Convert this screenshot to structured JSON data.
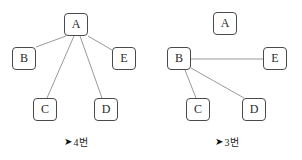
{
  "figure": {
    "background_color": "#ffffff",
    "node_border_color": "#4a4a4a",
    "node_fill_color": "#ffffff",
    "edge_color": "#9a9a9a",
    "text_color": "#2a2a2a"
  },
  "panels": [
    {
      "id": "left",
      "caption": {
        "arrow": "➤",
        "text": "4번"
      },
      "nodes": [
        {
          "id": "A",
          "label": "A",
          "x": 64,
          "y": 13
        },
        {
          "id": "B",
          "label": "B",
          "x": 12,
          "y": 47
        },
        {
          "id": "E",
          "label": "E",
          "x": 112,
          "y": 47
        },
        {
          "id": "C",
          "label": "C",
          "x": 33,
          "y": 98
        },
        {
          "id": "D",
          "label": "D",
          "x": 94,
          "y": 98
        }
      ],
      "edges": [
        {
          "from": "A",
          "to": "B",
          "x1": 66,
          "y1": 36,
          "x2": 36,
          "y2": 47
        },
        {
          "from": "A",
          "to": "E",
          "x1": 88,
          "y1": 36,
          "x2": 112,
          "y2": 50
        },
        {
          "from": "A",
          "to": "C",
          "x1": 74,
          "y1": 36,
          "x2": 47,
          "y2": 98
        },
        {
          "from": "A",
          "to": "D",
          "x1": 80,
          "y1": 36,
          "x2": 102,
          "y2": 98
        }
      ],
      "edge_count": 4
    },
    {
      "id": "right",
      "caption": {
        "arrow": "➤",
        "text": "3번"
      },
      "nodes": [
        {
          "id": "A",
          "label": "A",
          "x": 62,
          "y": 12
        },
        {
          "id": "B",
          "label": "B",
          "x": 16,
          "y": 47
        },
        {
          "id": "E",
          "label": "E",
          "x": 112,
          "y": 47
        },
        {
          "id": "C",
          "label": "C",
          "x": 35,
          "y": 98
        },
        {
          "id": "D",
          "label": "D",
          "x": 91,
          "y": 98
        }
      ],
      "edges": [
        {
          "from": "B",
          "to": "E",
          "x1": 40,
          "y1": 59,
          "x2": 112,
          "y2": 59
        },
        {
          "from": "B",
          "to": "C",
          "x1": 34,
          "y1": 70,
          "x2": 45,
          "y2": 98
        },
        {
          "from": "B",
          "to": "D",
          "x1": 40,
          "y1": 68,
          "x2": 93,
          "y2": 98
        }
      ],
      "edge_count": 3
    }
  ]
}
